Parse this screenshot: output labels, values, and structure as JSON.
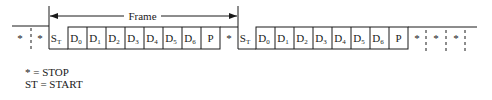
{
  "frame_label": "Frame",
  "frames": [
    {
      "start": {
        "main": "S",
        "sub": "T"
      },
      "bits": [
        {
          "main": "D",
          "sub": "0"
        },
        {
          "main": "D",
          "sub": "1"
        },
        {
          "main": "D",
          "sub": "2"
        },
        {
          "main": "D",
          "sub": "3"
        },
        {
          "main": "D",
          "sub": "4"
        },
        {
          "main": "D",
          "sub": "5"
        },
        {
          "main": "D",
          "sub": "6"
        }
      ],
      "parity": "P",
      "stop": "*"
    },
    {
      "start": {
        "main": "S",
        "sub": "T"
      },
      "bits": [
        {
          "main": "D",
          "sub": "0"
        },
        {
          "main": "D",
          "sub": "1"
        },
        {
          "main": "D",
          "sub": "2"
        },
        {
          "main": "D",
          "sub": "3"
        },
        {
          "main": "D",
          "sub": "4"
        },
        {
          "main": "D",
          "sub": "5"
        },
        {
          "main": "D",
          "sub": "6"
        }
      ],
      "parity": "P",
      "stop": "*"
    }
  ],
  "leading_stops": [
    "*",
    "*"
  ],
  "trailing_stops": [
    "*",
    "*",
    "*"
  ],
  "legend": {
    "line1": "* = STOP",
    "line2": "ST = START"
  }
}
